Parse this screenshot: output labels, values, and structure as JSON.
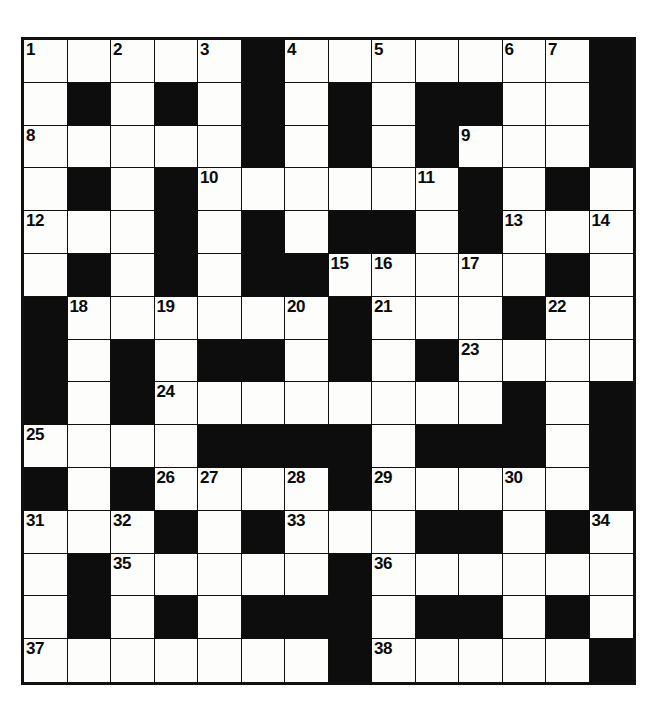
{
  "puzzle": {
    "title": "Crossword Grid",
    "type": "crossword",
    "columns": 14,
    "rows": 15,
    "cell_width_px": 43.5,
    "cell_height_px": 42.8,
    "colors": {
      "light_cell": "#fdfdfb",
      "dark_cell": "#0d0d0d",
      "grid_line": "#111111",
      "number_text": "#0b0b0b",
      "page_background": "#ffffff"
    },
    "legend": {
      "light": "open / fillable letter square",
      "dark": "blocked square"
    },
    "grid": [
      [
        "L1",
        "L",
        "L2",
        "L",
        "L3",
        "D",
        "L4",
        "L",
        "L5",
        "L",
        "L",
        "L6",
        "L7",
        "D"
      ],
      [
        "L",
        "D",
        "L",
        "D",
        "L",
        "D",
        "L",
        "D",
        "L",
        "D",
        "D",
        "L",
        "L",
        "D"
      ],
      [
        "L8",
        "L",
        "L",
        "L",
        "L",
        "D",
        "L",
        "D",
        "L",
        "D",
        "L9",
        "L",
        "L",
        "D"
      ],
      [
        "L",
        "D",
        "L",
        "D",
        "L10",
        "L",
        "L",
        "L",
        "L",
        "L11",
        "D",
        "L",
        "D",
        "L"
      ],
      [
        "L12",
        "L",
        "L",
        "D",
        "L",
        "D",
        "L",
        "D",
        "D",
        "L",
        "D",
        "L13",
        "L",
        "L14"
      ],
      [
        "L",
        "D",
        "L",
        "D",
        "L",
        "D",
        "D",
        "L15",
        "L16",
        "L",
        "L17",
        "L",
        "D",
        "L"
      ],
      [
        "D",
        "L18",
        "L",
        "L19",
        "L",
        "L",
        "L20",
        "D",
        "L21",
        "L",
        "L",
        "D",
        "L22",
        "L"
      ],
      [
        "D",
        "L",
        "D",
        "L",
        "D",
        "D",
        "L",
        "D",
        "L",
        "D",
        "L23",
        "L",
        "L",
        "L"
      ],
      [
        "D",
        "L",
        "D",
        "L24",
        "L",
        "L",
        "L",
        "L",
        "L",
        "L",
        "L",
        "D",
        "L",
        "D"
      ],
      [
        "L25",
        "L",
        "L",
        "L",
        "D",
        "D",
        "D",
        "D",
        "L",
        "D",
        "D",
        "D",
        "L",
        "D"
      ],
      [
        "D",
        "L",
        "D",
        "L26",
        "L27",
        "L",
        "L28",
        "D",
        "L29",
        "L",
        "L",
        "L30",
        "L",
        "D"
      ],
      [
        "L31",
        "L",
        "L32",
        "D",
        "L",
        "D",
        "L33",
        "L",
        "L",
        "D",
        "D",
        "L",
        "D",
        "L34"
      ],
      [
        "L",
        "D",
        "L35",
        "L",
        "L",
        "L",
        "L",
        "D",
        "L36",
        "L",
        "L",
        "L",
        "L",
        "L"
      ],
      [
        "L",
        "D",
        "L",
        "D",
        "L",
        "D",
        "D",
        "D",
        "L",
        "D",
        "D",
        "L",
        "D",
        "L"
      ],
      [
        "L37",
        "L",
        "L",
        "L",
        "L",
        "L",
        "L",
        "D",
        "L38",
        "L",
        "L",
        "L",
        "L",
        "D"
      ]
    ],
    "clue_numbers": [
      {
        "number": "1",
        "row": 0,
        "col": 0
      },
      {
        "number": "2",
        "row": 0,
        "col": 2
      },
      {
        "number": "3",
        "row": 0,
        "col": 4
      },
      {
        "number": "4",
        "row": 0,
        "col": 6
      },
      {
        "number": "5",
        "row": 0,
        "col": 8
      },
      {
        "number": "6",
        "row": 0,
        "col": 11
      },
      {
        "number": "7",
        "row": 0,
        "col": 12
      },
      {
        "number": "8",
        "row": 2,
        "col": 0
      },
      {
        "number": "9",
        "row": 2,
        "col": 10
      },
      {
        "number": "10",
        "row": 3,
        "col": 4
      },
      {
        "number": "11",
        "row": 3,
        "col": 9
      },
      {
        "number": "12",
        "row": 4,
        "col": 0
      },
      {
        "number": "13",
        "row": 4,
        "col": 11
      },
      {
        "number": "14",
        "row": 4,
        "col": 13
      },
      {
        "number": "15",
        "row": 5,
        "col": 7
      },
      {
        "number": "16",
        "row": 5,
        "col": 8
      },
      {
        "number": "17",
        "row": 5,
        "col": 10
      },
      {
        "number": "18",
        "row": 6,
        "col": 1
      },
      {
        "number": "19",
        "row": 6,
        "col": 3
      },
      {
        "number": "20",
        "row": 6,
        "col": 6
      },
      {
        "number": "21",
        "row": 6,
        "col": 8
      },
      {
        "number": "22",
        "row": 6,
        "col": 12
      },
      {
        "number": "23",
        "row": 7,
        "col": 10
      },
      {
        "number": "24",
        "row": 8,
        "col": 3
      },
      {
        "number": "25",
        "row": 9,
        "col": 0
      },
      {
        "number": "26",
        "row": 10,
        "col": 3
      },
      {
        "number": "27",
        "row": 10,
        "col": 4
      },
      {
        "number": "28",
        "row": 10,
        "col": 6
      },
      {
        "number": "29",
        "row": 10,
        "col": 8
      },
      {
        "number": "30",
        "row": 10,
        "col": 11
      },
      {
        "number": "31",
        "row": 11,
        "col": 0
      },
      {
        "number": "32",
        "row": 11,
        "col": 2
      },
      {
        "number": "33",
        "row": 11,
        "col": 6
      },
      {
        "number": "34",
        "row": 11,
        "col": 13
      },
      {
        "number": "35",
        "row": 12,
        "col": 2
      },
      {
        "number": "36",
        "row": 12,
        "col": 8
      },
      {
        "number": "37",
        "row": 14,
        "col": 0
      },
      {
        "number": "38",
        "row": 14,
        "col": 8
      }
    ]
  }
}
